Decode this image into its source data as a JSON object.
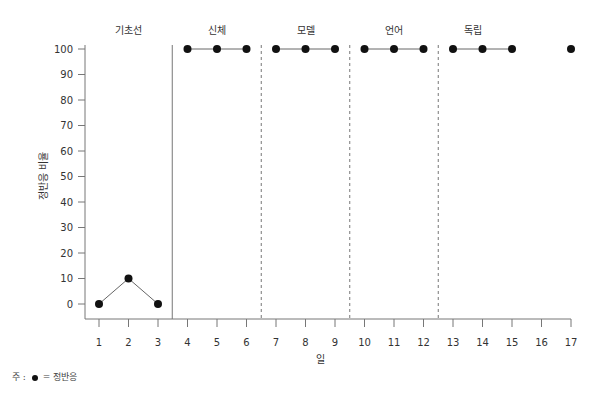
{
  "chart_data": {
    "type": "line",
    "title": "",
    "xlabel": "일",
    "ylabel": "정반응 비율",
    "x_ticks": [
      1,
      2,
      3,
      4,
      5,
      6,
      7,
      8,
      9,
      10,
      11,
      12,
      13,
      14,
      15,
      16,
      17
    ],
    "y_ticks": [
      0,
      10,
      20,
      30,
      40,
      50,
      60,
      70,
      80,
      90,
      100
    ],
    "xlim": [
      1,
      17
    ],
    "ylim": [
      0,
      100
    ],
    "grid": false,
    "legend_position": "bottom-left note",
    "phases": [
      {
        "label": "기초선",
        "days": [
          1,
          2,
          3
        ],
        "boundary_after": 3.5,
        "boundary_style": "solid"
      },
      {
        "label": "신체",
        "days": [
          4,
          5,
          6
        ],
        "boundary_after": 6.5,
        "boundary_style": "dashed"
      },
      {
        "label": "모델",
        "days": [
          7,
          8,
          9
        ],
        "boundary_after": 9.5,
        "boundary_style": "dashed"
      },
      {
        "label": "언어",
        "days": [
          10,
          11,
          12
        ],
        "boundary_after": 12.5,
        "boundary_style": "dashed"
      },
      {
        "label": "독립",
        "days": [
          13,
          14,
          15,
          16,
          17
        ],
        "boundary_after": null,
        "boundary_style": null
      }
    ],
    "series": [
      {
        "name": "기초선",
        "x": [
          1,
          2,
          3
        ],
        "y": [
          0,
          10,
          0
        ],
        "connected": true
      },
      {
        "name": "신체",
        "x": [
          4,
          5,
          6
        ],
        "y": [
          100,
          100,
          100
        ],
        "connected": true
      },
      {
        "name": "모델",
        "x": [
          7,
          8,
          9
        ],
        "y": [
          100,
          100,
          100
        ],
        "connected": true
      },
      {
        "name": "언어",
        "x": [
          10,
          11,
          12
        ],
        "y": [
          100,
          100,
          100
        ],
        "connected": true
      },
      {
        "name": "독립",
        "x": [
          13,
          14,
          15
        ],
        "y": [
          100,
          100,
          100
        ],
        "connected": true
      },
      {
        "name": "독립 (follow-up)",
        "x": [
          17
        ],
        "y": [
          100
        ],
        "connected": false
      }
    ],
    "marker": "filled-circle",
    "note": "주 : ● = 정반응"
  },
  "note": {
    "prefix": "주 :",
    "suffix": "= 정반응"
  },
  "colors": {
    "marker": "#111111",
    "line": "#666666",
    "axis": "#777777",
    "text": "#333333"
  }
}
